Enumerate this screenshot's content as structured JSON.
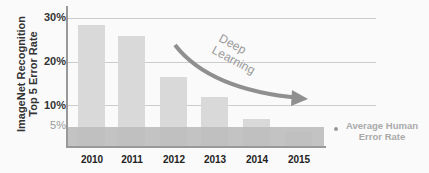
{
  "chart_data": {
    "type": "bar",
    "title": "",
    "ylabel": "ImageNet Recognition Top 5 Error Rate",
    "xlabel": "",
    "categories": [
      "2010",
      "2011",
      "2012",
      "2013",
      "2014",
      "2015"
    ],
    "values": [
      28.2,
      25.8,
      16.4,
      11.7,
      6.7,
      3.6
    ],
    "y_ticks": [
      "30%",
      "20%",
      "10%",
      "5%"
    ],
    "ylim": [
      0,
      32
    ],
    "grid": true,
    "reference_band": {
      "label": "Average Human Error Rate",
      "value": 5.1
    },
    "annotation": {
      "text": "Deep Learning",
      "type": "downward curved arrow"
    }
  },
  "labels": {
    "ylabel_line1": "ImageNet Recognition",
    "ylabel_line2": "Top 5 Error Rate",
    "annotation_line1": "Deep",
    "annotation_line2": "Learning",
    "human_line1": "Average Human",
    "human_line2": "Error Rate"
  }
}
